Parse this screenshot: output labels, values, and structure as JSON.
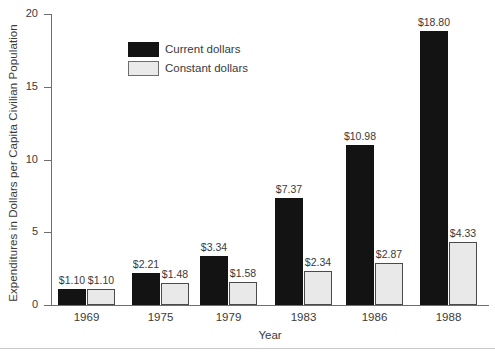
{
  "chart_data": {
    "type": "bar",
    "title": "",
    "xlabel": "Year",
    "ylabel": "Expenditures in Dollars per Capita Civilian Population",
    "categories": [
      "1969",
      "1975",
      "1979",
      "1983",
      "1986",
      "1988"
    ],
    "ylim": [
      0,
      20
    ],
    "yticks": [
      0,
      5,
      10,
      15,
      20
    ],
    "ytick_labels": [
      "0",
      "5",
      "10",
      "15",
      "20"
    ],
    "grid": false,
    "legend_position": "upper-left-inside",
    "series": [
      {
        "name": "Current dollars",
        "color": "#131313",
        "values": [
          1.1,
          2.21,
          3.34,
          7.37,
          10.98,
          18.8
        ],
        "labels": [
          "$1.10",
          "$2.21",
          "$3.34",
          "$7.37",
          "$10.98",
          "$18.80"
        ]
      },
      {
        "name": "Constant dollars",
        "color": "#e9e9e9",
        "border_color": "#4a4a4a",
        "values": [
          1.1,
          1.48,
          1.58,
          2.34,
          2.87,
          4.33
        ],
        "labels": [
          "$1.10",
          "$1.48",
          "$1.58",
          "$2.34",
          "$2.87",
          "$4.33"
        ]
      }
    ]
  },
  "legend": {
    "items": [
      {
        "label": "Current dollars",
        "swatch": "current"
      },
      {
        "label": "Constant dollars",
        "swatch": "constant"
      }
    ]
  }
}
